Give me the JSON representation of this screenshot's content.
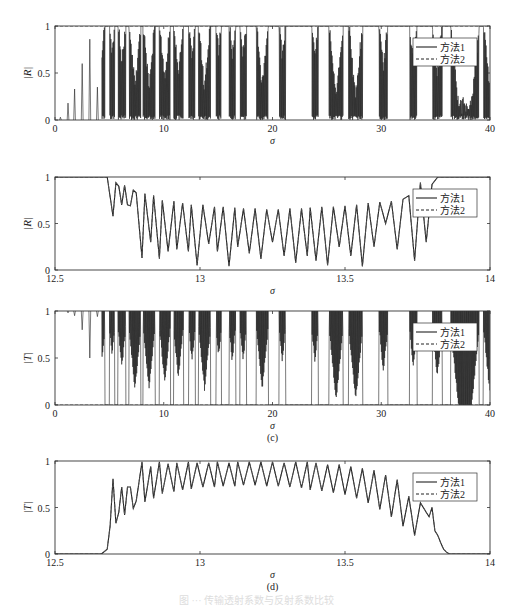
{
  "figure": {
    "caption": "图 ··· 传输透射系数与反射系数比较",
    "legend": [
      "方法1",
      "方法2"
    ]
  },
  "chart_data": [
    {
      "id": "a",
      "type": "line",
      "panel_label": "(a)",
      "xlabel": "σ",
      "ylabel": "|R|",
      "xlim": [
        0,
        40
      ],
      "ylim": [
        0,
        1
      ],
      "xticks": [
        0,
        10,
        20,
        30,
        40
      ],
      "yticks": [
        0,
        0.5,
        1
      ],
      "grid": false,
      "legend_position": "upper right",
      "series": [
        {
          "name": "方法1",
          "style": "solid"
        },
        {
          "name": "方法2",
          "style": "dashed"
        }
      ],
      "notes": "Dense oscillatory reflection coefficient; isolated spikes below σ≈5 (peaks ~0.05,0.18,0.33,0.6,0.86,0.35), then bands of total reflection (|R|=1) alternating with dense filled regions down to 0.",
      "peaks_low_sigma": [
        [
          0.5,
          0.03
        ],
        [
          1.2,
          0.18
        ],
        [
          1.8,
          0.33
        ],
        [
          2.5,
          0.6
        ],
        [
          3.2,
          0.86
        ],
        [
          3.9,
          0.35
        ]
      ]
    },
    {
      "id": "b",
      "type": "line",
      "panel_label": "(b)",
      "xlabel": "σ",
      "ylabel": "|R|",
      "xlim": [
        12.5,
        14
      ],
      "ylim": [
        0,
        1
      ],
      "xticks": [
        12.5,
        13,
        13.5,
        14
      ],
      "yticks": [
        0,
        0.5,
        1
      ],
      "grid": false,
      "legend_position": "upper right",
      "series": [
        {
          "name": "方法1",
          "style": "solid"
        },
        {
          "name": "方法2",
          "style": "dashed"
        }
      ],
      "x": [
        12.5,
        12.68,
        12.7,
        12.71,
        12.72,
        12.73,
        12.74,
        12.75,
        12.76,
        12.77,
        12.78,
        12.8,
        12.81,
        12.83,
        12.84,
        12.86,
        12.87,
        12.89,
        12.91,
        12.92,
        12.94,
        12.96,
        12.97,
        12.99,
        13.01,
        13.03,
        13.05,
        13.06,
        13.08,
        13.1,
        13.12,
        13.13,
        13.15,
        13.17,
        13.19,
        13.21,
        13.23,
        13.25,
        13.27,
        13.29,
        13.31,
        13.33,
        13.35,
        13.37,
        13.38,
        13.4,
        13.42,
        13.44,
        13.46,
        13.48,
        13.5,
        13.52,
        13.54,
        13.56,
        13.58,
        13.6,
        13.62,
        13.64,
        13.66,
        13.68,
        13.7,
        13.72,
        13.74,
        13.76,
        13.78,
        13.8,
        13.82,
        13.83,
        13.84,
        13.85,
        13.86,
        13.87,
        13.88,
        14.0
      ],
      "values": [
        1,
        1,
        0.58,
        0.94,
        0.9,
        0.7,
        0.91,
        0.7,
        0.69,
        0.86,
        0.83,
        0.13,
        0.82,
        0.3,
        0.8,
        0.12,
        0.75,
        0.2,
        0.74,
        0.22,
        0.72,
        0.2,
        0.7,
        0.05,
        0.7,
        0.28,
        0.68,
        0.2,
        0.68,
        0.04,
        0.67,
        0.25,
        0.66,
        0.18,
        0.66,
        0.12,
        0.65,
        0.3,
        0.65,
        0.15,
        0.66,
        0.08,
        0.66,
        0.15,
        0.67,
        0.1,
        0.68,
        0.05,
        0.68,
        0.25,
        0.69,
        0.15,
        0.7,
        0.04,
        0.72,
        0.25,
        0.73,
        0.5,
        0.74,
        0.22,
        0.76,
        0.8,
        0.1,
        0.94,
        0.3,
        0.92,
        1,
        1,
        1,
        1,
        1,
        1,
        1,
        1
      ]
    },
    {
      "id": "c",
      "type": "line",
      "panel_label": "(c)",
      "xlabel": "σ",
      "ylabel": "|T|",
      "xlim": [
        0,
        40
      ],
      "ylim": [
        0,
        1
      ],
      "xticks": [
        0,
        10,
        20,
        30,
        40
      ],
      "yticks": [
        0,
        0.5,
        1
      ],
      "grid": false,
      "legend_position": "upper right",
      "series": [
        {
          "name": "方法1",
          "style": "solid"
        },
        {
          "name": "方法2",
          "style": "dashed"
        }
      ],
      "notes": "Transmission coefficient, complement of (a): small dips below σ≈5 (to ~0.97,0.95,0.8,0.5,0.95), then stopbands at 0 alternating with dense filled regions up to 1.",
      "dips_low_sigma": [
        [
          1.2,
          0.98
        ],
        [
          1.8,
          0.95
        ],
        [
          2.5,
          0.8
        ],
        [
          3.2,
          0.5
        ],
        [
          3.9,
          0.94
        ]
      ]
    },
    {
      "id": "d",
      "type": "line",
      "panel_label": "(d)",
      "xlabel": "σ",
      "ylabel": "|T|",
      "xlim": [
        12.5,
        14
      ],
      "ylim": [
        0,
        1
      ],
      "xticks": [
        12.5,
        13,
        13.5,
        14
      ],
      "yticks": [
        0,
        0.5,
        1
      ],
      "grid": false,
      "legend_position": "upper right",
      "series": [
        {
          "name": "方法1",
          "style": "solid"
        },
        {
          "name": "方法2",
          "style": "dashed"
        }
      ],
      "x": [
        12.5,
        12.66,
        12.68,
        12.69,
        12.7,
        12.71,
        12.72,
        12.73,
        12.74,
        12.75,
        12.76,
        12.77,
        12.78,
        12.8,
        12.81,
        12.83,
        12.84,
        12.86,
        12.87,
        12.89,
        12.91,
        12.92,
        12.94,
        12.96,
        12.97,
        12.99,
        13.01,
        13.03,
        13.05,
        13.06,
        13.08,
        13.1,
        13.12,
        13.13,
        13.15,
        13.17,
        13.19,
        13.21,
        13.23,
        13.25,
        13.27,
        13.29,
        13.31,
        13.33,
        13.35,
        13.37,
        13.38,
        13.4,
        13.42,
        13.44,
        13.46,
        13.48,
        13.5,
        13.52,
        13.54,
        13.56,
        13.58,
        13.6,
        13.62,
        13.64,
        13.66,
        13.68,
        13.7,
        13.72,
        13.74,
        13.76,
        13.78,
        13.79,
        13.8,
        13.81,
        13.82,
        13.83,
        13.84,
        13.85,
        13.86,
        13.87,
        13.88,
        14.0
      ],
      "values": [
        0,
        0,
        0.05,
        0.3,
        0.81,
        0.33,
        0.45,
        0.72,
        0.42,
        0.72,
        0.72,
        0.49,
        0.57,
        0.99,
        0.56,
        0.94,
        0.6,
        0.99,
        0.65,
        0.97,
        0.67,
        0.98,
        0.69,
        0.99,
        0.7,
        0.98,
        0.72,
        0.98,
        0.72,
        0.99,
        0.73,
        0.98,
        0.73,
        0.99,
        0.74,
        0.99,
        0.74,
        0.99,
        0.73,
        0.99,
        0.73,
        0.98,
        0.72,
        0.99,
        0.71,
        0.99,
        0.69,
        0.98,
        0.68,
        0.96,
        0.66,
        0.96,
        0.64,
        0.94,
        0.6,
        0.92,
        0.55,
        0.9,
        0.48,
        0.85,
        0.4,
        0.8,
        0.3,
        0.62,
        0.2,
        0.55,
        0.45,
        0.4,
        0.5,
        0.25,
        0.2,
        0.12,
        0.05,
        0.02,
        0,
        0,
        0,
        0
      ]
    }
  ]
}
